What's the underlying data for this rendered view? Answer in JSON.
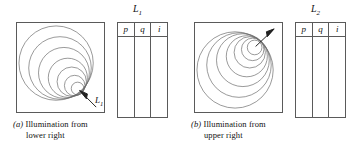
{
  "figure": {
    "panels": [
      {
        "id": "a",
        "light_label": "L",
        "light_sub": "1",
        "table_title": "L",
        "table_title_sub": "1",
        "table_headers": [
          "p",
          "q",
          "i"
        ],
        "table_body_row": [
          "",
          "",
          ""
        ],
        "caption_letter": "(a)",
        "caption_line1": "Illumination  from",
        "caption_line2": "lower  right",
        "arrow_direction": "lower-left",
        "convergence": "lower right",
        "circle_count": 7
      },
      {
        "id": "b",
        "light_label": "L",
        "light_sub": "2",
        "table_title": "L",
        "table_title_sub": "2",
        "table_headers": [
          "p",
          "q",
          "i"
        ],
        "table_body_row": [
          "",
          "",
          ""
        ],
        "caption_letter": "(b)",
        "caption_line1": "Illumination  from",
        "caption_line2": "upper  right",
        "arrow_direction": "upper-right",
        "convergence": "upper right",
        "circle_count": 7
      }
    ],
    "colors": {
      "stroke": "#5a5a5a",
      "circle_stroke": "#6b6b6b",
      "text": "#111111",
      "background": "#ffffff"
    }
  }
}
